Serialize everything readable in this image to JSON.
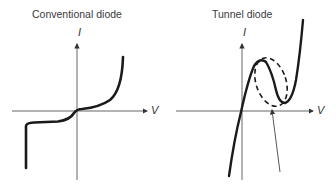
{
  "panels": [
    {
      "title": "Conventional diode",
      "y_axis_label": "I",
      "x_axis_label": "V",
      "curve": "conventional-iv-characteristic"
    },
    {
      "title": "Tunnel diode",
      "y_axis_label": "I",
      "x_axis_label": "V",
      "curve": "tunnel-iv-characteristic",
      "annotation": "negative-resistance-region-highlight"
    }
  ],
  "colors": {
    "curve": "#1a1a1a",
    "axis": "#555555",
    "text": "#3a3a3a"
  }
}
